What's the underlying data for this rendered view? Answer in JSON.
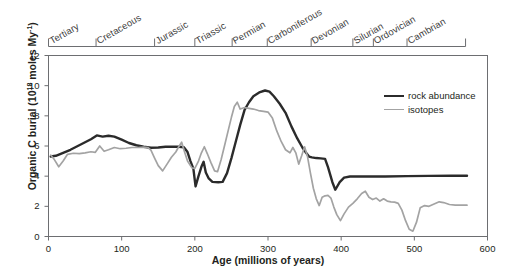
{
  "chart_data": {
    "type": "line",
    "title": "",
    "xlabel": "Age (millions of years)",
    "ylabel": "Organic C burial (10^18 moles My^-1)",
    "ylabel_main": "Organic C burial (10",
    "ylabel_exp": "18",
    "ylabel_tail": " moles My",
    "ylabel_exp2": "-1",
    "ylabel_close": ")",
    "xlim": [
      0,
      600
    ],
    "ylim": [
      0,
      12
    ],
    "xticks": [
      0,
      100,
      200,
      300,
      400,
      500,
      600
    ],
    "yticks": [
      0,
      2,
      4,
      6,
      8,
      10,
      12
    ],
    "grid": false,
    "legend_position": "top-right",
    "x_reversed": false,
    "series": [
      {
        "name": "rock abundance",
        "color": "#2b2b2b",
        "width": 2.4,
        "points": [
          [
            3,
            5.3
          ],
          [
            10,
            5.35
          ],
          [
            20,
            5.55
          ],
          [
            30,
            5.75
          ],
          [
            40,
            6.0
          ],
          [
            50,
            6.25
          ],
          [
            58,
            6.45
          ],
          [
            66,
            6.7
          ],
          [
            74,
            6.62
          ],
          [
            82,
            6.68
          ],
          [
            90,
            6.62
          ],
          [
            100,
            6.42
          ],
          [
            110,
            6.2
          ],
          [
            120,
            6.05
          ],
          [
            130,
            5.95
          ],
          [
            140,
            5.88
          ],
          [
            150,
            5.9
          ],
          [
            160,
            5.95
          ],
          [
            170,
            5.95
          ],
          [
            178,
            5.95
          ],
          [
            185,
            5.92
          ],
          [
            190,
            5.6
          ],
          [
            194,
            5.0
          ],
          [
            198,
            4.5
          ],
          [
            201,
            3.32
          ],
          [
            205,
            4.0
          ],
          [
            209,
            4.62
          ],
          [
            212,
            4.95
          ],
          [
            215,
            4.25
          ],
          [
            219,
            3.85
          ],
          [
            224,
            3.62
          ],
          [
            232,
            3.6
          ],
          [
            238,
            3.62
          ],
          [
            244,
            4.2
          ],
          [
            250,
            5.2
          ],
          [
            256,
            6.3
          ],
          [
            262,
            7.4
          ],
          [
            268,
            8.4
          ],
          [
            274,
            8.9
          ],
          [
            280,
            9.3
          ],
          [
            288,
            9.55
          ],
          [
            296,
            9.68
          ],
          [
            302,
            9.6
          ],
          [
            308,
            9.3
          ],
          [
            316,
            8.8
          ],
          [
            324,
            8.2
          ],
          [
            332,
            7.3
          ],
          [
            340,
            6.5
          ],
          [
            347,
            5.9
          ],
          [
            352,
            5.55
          ],
          [
            356,
            5.3
          ],
          [
            360,
            5.25
          ],
          [
            366,
            5.2
          ],
          [
            372,
            5.18
          ],
          [
            378,
            5.15
          ],
          [
            382,
            4.6
          ],
          [
            388,
            3.6
          ],
          [
            392,
            3.1
          ],
          [
            398,
            3.6
          ],
          [
            404,
            3.9
          ],
          [
            412,
            3.98
          ],
          [
            430,
            3.98
          ],
          [
            460,
            3.98
          ],
          [
            490,
            4.0
          ],
          [
            520,
            4.02
          ],
          [
            550,
            4.03
          ],
          [
            572,
            4.03
          ]
        ]
      },
      {
        "name": "isotopes",
        "color": "#a3a3a3",
        "width": 1.7,
        "points": [
          [
            3,
            5.4
          ],
          [
            8,
            5.1
          ],
          [
            14,
            4.62
          ],
          [
            20,
            5.0
          ],
          [
            26,
            5.45
          ],
          [
            34,
            5.52
          ],
          [
            42,
            5.5
          ],
          [
            50,
            5.55
          ],
          [
            58,
            5.62
          ],
          [
            64,
            5.58
          ],
          [
            70,
            6.0
          ],
          [
            76,
            5.65
          ],
          [
            82,
            5.75
          ],
          [
            90,
            5.9
          ],
          [
            98,
            5.82
          ],
          [
            106,
            5.85
          ],
          [
            114,
            5.9
          ],
          [
            122,
            5.9
          ],
          [
            130,
            5.92
          ],
          [
            136,
            5.9
          ],
          [
            140,
            5.72
          ],
          [
            145,
            5.2
          ],
          [
            150,
            4.7
          ],
          [
            156,
            4.35
          ],
          [
            162,
            4.8
          ],
          [
            168,
            5.25
          ],
          [
            174,
            5.6
          ],
          [
            178,
            5.95
          ],
          [
            182,
            6.25
          ],
          [
            186,
            5.6
          ],
          [
            190,
            5.0
          ],
          [
            196,
            4.55
          ],
          [
            200,
            4.52
          ],
          [
            205,
            5.0
          ],
          [
            209,
            5.55
          ],
          [
            213,
            5.95
          ],
          [
            217,
            5.5
          ],
          [
            222,
            4.9
          ],
          [
            227,
            4.35
          ],
          [
            231,
            4.3
          ],
          [
            236,
            5.1
          ],
          [
            241,
            6.1
          ],
          [
            246,
            7.1
          ],
          [
            250,
            7.9
          ],
          [
            254,
            8.62
          ],
          [
            258,
            8.9
          ],
          [
            262,
            8.45
          ],
          [
            268,
            8.55
          ],
          [
            274,
            8.5
          ],
          [
            280,
            8.45
          ],
          [
            287,
            8.35
          ],
          [
            294,
            8.3
          ],
          [
            300,
            8.25
          ],
          [
            306,
            7.85
          ],
          [
            312,
            7.0
          ],
          [
            318,
            6.3
          ],
          [
            324,
            5.75
          ],
          [
            330,
            5.55
          ],
          [
            334,
            5.9
          ],
          [
            338,
            5.55
          ],
          [
            342,
            4.8
          ],
          [
            346,
            5.35
          ],
          [
            350,
            5.95
          ],
          [
            354,
            5.3
          ],
          [
            358,
            4.2
          ],
          [
            362,
            3.2
          ],
          [
            366,
            2.5
          ],
          [
            370,
            2.05
          ],
          [
            374,
            2.6
          ],
          [
            378,
            2.7
          ],
          [
            382,
            2.72
          ],
          [
            386,
            2.55
          ],
          [
            390,
            1.95
          ],
          [
            394,
            1.45
          ],
          [
            399,
            1.05
          ],
          [
            404,
            1.5
          ],
          [
            410,
            1.95
          ],
          [
            416,
            2.2
          ],
          [
            422,
            2.5
          ],
          [
            428,
            2.85
          ],
          [
            433,
            3.0
          ],
          [
            438,
            2.6
          ],
          [
            443,
            2.45
          ],
          [
            448,
            2.55
          ],
          [
            453,
            2.35
          ],
          [
            458,
            2.5
          ],
          [
            463,
            2.35
          ],
          [
            468,
            2.3
          ],
          [
            473,
            2.28
          ],
          [
            478,
            2.2
          ],
          [
            483,
            1.75
          ],
          [
            488,
            1.05
          ],
          [
            493,
            0.48
          ],
          [
            498,
            0.35
          ],
          [
            503,
            0.95
          ],
          [
            508,
            1.9
          ],
          [
            514,
            2.05
          ],
          [
            520,
            2.0
          ],
          [
            527,
            2.15
          ],
          [
            534,
            2.3
          ],
          [
            540,
            2.25
          ],
          [
            548,
            2.12
          ],
          [
            556,
            2.08
          ],
          [
            564,
            2.08
          ],
          [
            572,
            2.08
          ]
        ]
      }
    ],
    "periods": [
      {
        "label": "Tertiary",
        "start": 0,
        "end": 65
      },
      {
        "label": "Cretaceous",
        "start": 65,
        "end": 145
      },
      {
        "label": "Jurassic",
        "start": 145,
        "end": 200
      },
      {
        "label": "Triassic",
        "start": 200,
        "end": 251
      },
      {
        "label": "Permian",
        "start": 251,
        "end": 299
      },
      {
        "label": "Carboniferous",
        "start": 299,
        "end": 359
      },
      {
        "label": "Devonian",
        "start": 359,
        "end": 416
      },
      {
        "label": "Silurian",
        "start": 416,
        "end": 444
      },
      {
        "label": "Ordovician",
        "start": 444,
        "end": 490
      },
      {
        "label": "Cambrian",
        "start": 490,
        "end": 570
      }
    ]
  },
  "axes": {
    "y_title_parts": {
      "a": "Organic C burial (10",
      "sup1": "18",
      "b": " moles My",
      "sup2": "-1",
      "c": ")"
    },
    "x_title": "Age (millions of years)"
  },
  "legend": {
    "items": [
      {
        "label": "rock abundance",
        "color": "#2b2b2b"
      },
      {
        "label": "isotopes",
        "color": "#a3a3a3"
      }
    ]
  }
}
